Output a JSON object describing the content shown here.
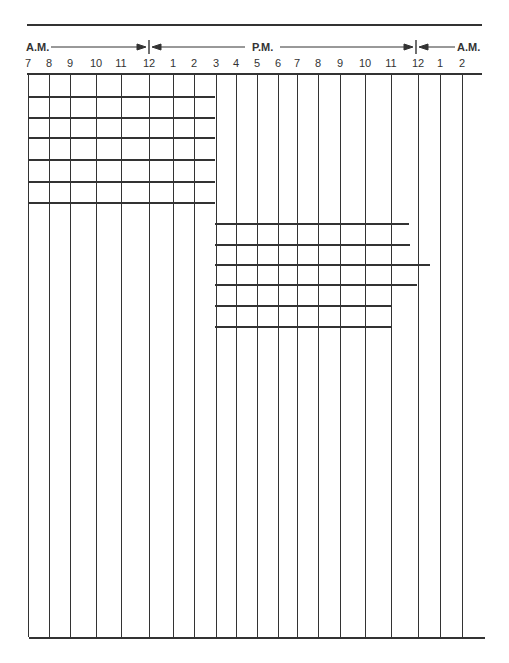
{
  "header": {
    "am_left": "A.M.",
    "pm": "P.M.",
    "am_right": "A.M."
  },
  "hours": [
    {
      "label": "7",
      "x": 28
    },
    {
      "label": "8",
      "x": 49
    },
    {
      "label": "9",
      "x": 70
    },
    {
      "label": "10",
      "x": 96
    },
    {
      "label": "11",
      "x": 121
    },
    {
      "label": "12",
      "x": 149
    },
    {
      "label": "1",
      "x": 173
    },
    {
      "label": "2",
      "x": 194
    },
    {
      "label": "3",
      "x": 216
    },
    {
      "label": "4",
      "x": 236
    },
    {
      "label": "5",
      "x": 257
    },
    {
      "label": "6",
      "x": 278
    },
    {
      "label": "7",
      "x": 297
    },
    {
      "label": "8",
      "x": 318
    },
    {
      "label": "9",
      "x": 340
    },
    {
      "label": "10",
      "x": 365
    },
    {
      "label": "11",
      "x": 391
    },
    {
      "label": "12",
      "x": 418
    },
    {
      "label": "1",
      "x": 440
    },
    {
      "label": "2",
      "x": 462
    }
  ],
  "grid": {
    "top_rule": {
      "y": 24,
      "x1": 27,
      "x2": 482
    },
    "header_rule": {
      "y": 73,
      "x1": 27,
      "x2": 482
    },
    "bottom_rule": {
      "y": 637,
      "x1": 29,
      "x2": 485
    },
    "morning_rows": [
      {
        "y": 96
      },
      {
        "y": 117
      },
      {
        "y": 137
      },
      {
        "y": 159
      },
      {
        "y": 181
      },
      {
        "y": 202
      }
    ],
    "morning_rows_end_x": 215,
    "evening_rows": [
      {
        "y": 223,
        "x2": 409
      },
      {
        "y": 244,
        "x2": 410
      },
      {
        "y": 264,
        "x2": 430
      },
      {
        "y": 284,
        "x2": 417
      },
      {
        "y": 305,
        "x2": 391
      },
      {
        "y": 326,
        "x2": 391
      }
    ],
    "evening_rows_start_x": 215
  },
  "markers": {
    "noon_x": 149,
    "midnight_x": 416
  }
}
